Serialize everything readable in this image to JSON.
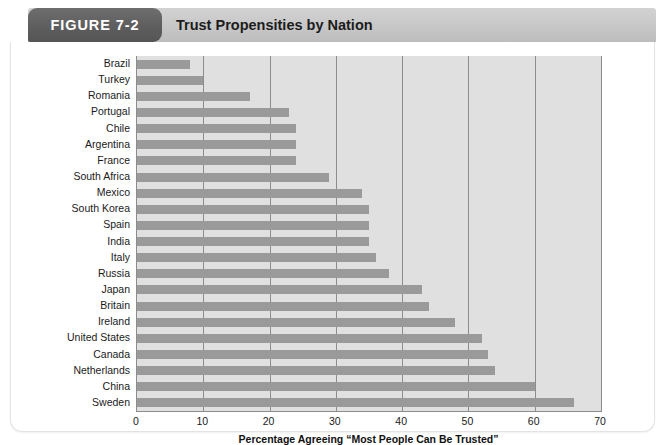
{
  "header": {
    "figure_tab_label": "FIGURE 7-2",
    "figure_title": "Trust Propensities by Nation",
    "tab_color": "#5e5e5e",
    "band_color": "#c9c9c9"
  },
  "chart_data": {
    "type": "bar",
    "orientation": "horizontal",
    "title": "Trust Propensities by Nation",
    "xlabel": "Percentage Agreeing “Most People Can Be Trusted”",
    "ylabel": "",
    "xlim": [
      0,
      70
    ],
    "xticks": [
      0,
      10,
      20,
      30,
      40,
      50,
      60,
      70
    ],
    "grid": "vertical",
    "legend": "none",
    "bar_color": "#9a9a9a",
    "plot_background": "#e0e0e0",
    "categories": [
      "Brazil",
      "Turkey",
      "Romania",
      "Portugal",
      "Chile",
      "Argentina",
      "France",
      "South Africa",
      "Mexico",
      "South Korea",
      "Spain",
      "India",
      "Italy",
      "Russia",
      "Japan",
      "Britain",
      "Ireland",
      "United States",
      "Canada",
      "Netherlands",
      "China",
      "Sweden"
    ],
    "values": [
      8,
      10,
      17,
      23,
      24,
      24,
      24,
      29,
      34,
      35,
      35,
      35,
      36,
      38,
      43,
      44,
      48,
      52,
      53,
      54,
      60,
      66
    ]
  }
}
